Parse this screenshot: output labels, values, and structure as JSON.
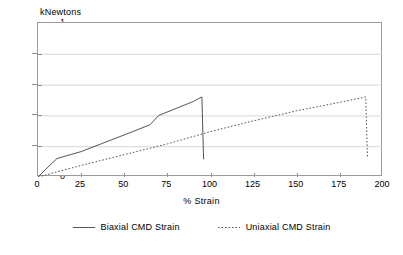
{
  "chart_data": {
    "type": "line",
    "title": "",
    "xlabel": "% Strain",
    "ylabel": "kNewtons",
    "xlim": [
      0,
      200
    ],
    "ylim": [
      0,
      1
    ],
    "xticks": [
      "0",
      "25",
      "50",
      "75",
      "100",
      "125",
      "150",
      "175",
      "200"
    ],
    "yticks": [
      "0",
      "0.2",
      "0.4",
      "0.6",
      "0.8",
      "1"
    ],
    "grid": "horizontal",
    "legend_position": "bottom",
    "series": [
      {
        "name": "Biaxial CMD Strain",
        "style": "solid",
        "color": "#555555",
        "points": [
          [
            0,
            0.0
          ],
          [
            4,
            0.045
          ],
          [
            11,
            0.12
          ],
          [
            25,
            0.165
          ],
          [
            40,
            0.23
          ],
          [
            55,
            0.295
          ],
          [
            65,
            0.34
          ],
          [
            70,
            0.4
          ],
          [
            80,
            0.445
          ],
          [
            90,
            0.49
          ],
          [
            95,
            0.52
          ],
          [
            96,
            0.115
          ]
        ]
      },
      {
        "name": "Uniaxial CMD Strain",
        "style": "dotted",
        "color": "#555555",
        "points": [
          [
            0,
            0.0
          ],
          [
            25,
            0.075
          ],
          [
            50,
            0.145
          ],
          [
            75,
            0.215
          ],
          [
            100,
            0.295
          ],
          [
            125,
            0.365
          ],
          [
            150,
            0.43
          ],
          [
            175,
            0.485
          ],
          [
            190,
            0.52
          ],
          [
            191,
            0.12
          ]
        ]
      }
    ]
  },
  "axes": {
    "y_unit_caption": "kNewtons",
    "x_axis_title": "% Strain",
    "y_tick_labels": [
      "1",
      "0.8",
      "0.6",
      "0.4",
      "0.2",
      "0"
    ],
    "x_tick_labels": [
      "0",
      "25",
      "50",
      "75",
      "100",
      "125",
      "150",
      "175",
      "200"
    ]
  },
  "legend": {
    "items": [
      {
        "label": "Biaxial CMD Strain",
        "style": "solid"
      },
      {
        "label": "Uniaxial CMD Strain",
        "style": "dotted"
      }
    ]
  },
  "colors": {
    "line": "#555555",
    "frame": "#9a9a9a",
    "grid": "#d7d7d7",
    "tick": "#8f8f8f",
    "text": "#000000",
    "background": "#ffffff"
  }
}
